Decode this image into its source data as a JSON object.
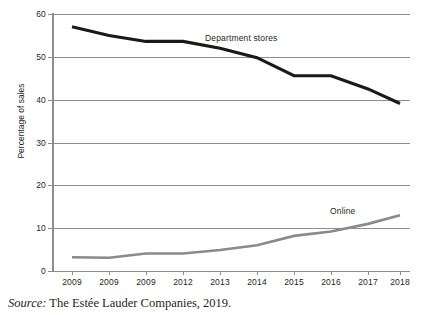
{
  "chart_data": {
    "type": "line",
    "title": "",
    "xlabel": "",
    "ylabel": "Percentage of sales",
    "ylim": [
      0,
      60
    ],
    "yticks": [
      0,
      10,
      20,
      30,
      40,
      50,
      60
    ],
    "grid": true,
    "legend_position": "inline-labels",
    "categories": [
      "2009",
      "2009",
      "2009",
      "2012",
      "2013",
      "2014",
      "2015",
      "2016",
      "2017",
      "2018"
    ],
    "series": [
      {
        "name": "Department stores",
        "color": "#1a1a1a",
        "values": [
          57.0,
          55.0,
          53.6,
          53.6,
          52.0,
          49.8,
          45.6,
          45.6,
          42.5,
          39.1
        ]
      },
      {
        "name": "Online",
        "color": "#8a8a8a",
        "values": [
          3.2,
          3.1,
          4.1,
          4.1,
          4.9,
          6.0,
          8.2,
          9.2,
          11.0,
          13.0
        ]
      }
    ],
    "annotations": [
      {
        "text": "Department stores",
        "series": "Department stores"
      },
      {
        "text": "Online",
        "series": "Online"
      }
    ]
  },
  "axis": {
    "y_tick_labels": [
      "60",
      "50",
      "40",
      "30",
      "20",
      "10",
      "0"
    ],
    "y_title": "Percentage of sales",
    "x_tick_labels": [
      "2009",
      "2009",
      "2009",
      "2012",
      "2013",
      "2014",
      "2015",
      "2016",
      "2017",
      "2018"
    ]
  },
  "labels": {
    "department_stores": "Department stores",
    "online": "Online"
  },
  "source": {
    "label": "Source:",
    "text": "The Estée Lauder Companies, 2019."
  },
  "colors": {
    "department_stores_line": "#1a1a1a",
    "online_line": "#8a8a8a",
    "gridline": "#8d8d8d",
    "text": "#231f20",
    "background": "#ffffff"
  }
}
